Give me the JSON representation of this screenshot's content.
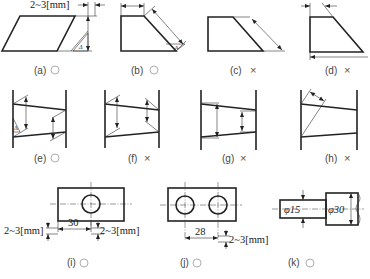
{
  "figure": {
    "panels": [
      {
        "id": "a",
        "label": "(a)",
        "verdict": "correct",
        "mark": "○",
        "annotation": "2~3[mm]",
        "symbol": "Δ"
      },
      {
        "id": "b",
        "label": "(b)",
        "verdict": "correct",
        "mark": "○",
        "symbol": "Δ"
      },
      {
        "id": "c",
        "label": "(c)",
        "verdict": "incorrect",
        "mark": "×"
      },
      {
        "id": "d",
        "label": "(d)",
        "verdict": "incorrect",
        "mark": "×"
      },
      {
        "id": "e",
        "label": "(e)",
        "verdict": "correct",
        "mark": "○",
        "symbol": "Δ"
      },
      {
        "id": "f",
        "label": "(f)",
        "verdict": "incorrect",
        "mark": "×"
      },
      {
        "id": "g",
        "label": "(g)",
        "verdict": "incorrect",
        "mark": "×"
      },
      {
        "id": "h",
        "label": "(h)",
        "verdict": "incorrect",
        "mark": "×"
      },
      {
        "id": "i",
        "label": "(i)",
        "verdict": "correct",
        "mark": "○",
        "dimension": "30",
        "annotation_left": "2~3[mm]",
        "annotation_right": "2~3[mm]"
      },
      {
        "id": "j",
        "label": "(j)",
        "verdict": "correct",
        "mark": "○",
        "dimension": "28",
        "annotation_right": "2~3[mm]"
      },
      {
        "id": "k",
        "label": "(k)",
        "verdict": "correct",
        "mark": "○",
        "diameter_small": "φ15",
        "diameter_large": "φ30"
      }
    ]
  },
  "labels": {
    "a": "(a)",
    "b": "(b)",
    "c": "(c)",
    "d": "(d)",
    "e": "(e)",
    "f": "(f)",
    "g": "(g)",
    "h": "(h)",
    "i": "(i)",
    "j": "(j)",
    "k": "(k)"
  },
  "marks": {
    "x": "×"
  },
  "dims": {
    "gap": "2~3[mm]",
    "i_spacing": "30",
    "j_spacing": "28",
    "k_small": "φ15",
    "k_large": "φ30",
    "delta": "Δ"
  }
}
